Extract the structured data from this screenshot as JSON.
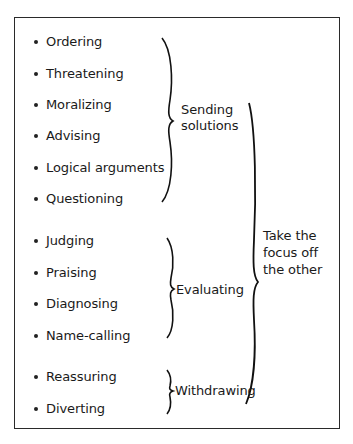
{
  "diagram": {
    "items": [
      {
        "label": "Ordering",
        "y": 34
      },
      {
        "label": "Threatening",
        "y": 66
      },
      {
        "label": "Moralizing",
        "y": 97
      },
      {
        "label": "Advising",
        "y": 128
      },
      {
        "label": "Logical arguments",
        "y": 160
      },
      {
        "label": "Questioning",
        "y": 191
      },
      {
        "label": "Judging",
        "y": 233
      },
      {
        "label": "Praising",
        "y": 265
      },
      {
        "label": "Diagnosing",
        "y": 296
      },
      {
        "label": "Name-calling",
        "y": 328
      },
      {
        "label": "Reassuring",
        "y": 369
      },
      {
        "label": "Diverting",
        "y": 401
      }
    ],
    "groups": [
      {
        "label_line1": "Sending",
        "label_line2": "solutions",
        "items": [
          "Ordering",
          "Threatening",
          "Moralizing",
          "Advising",
          "Logical arguments",
          "Questioning"
        ]
      },
      {
        "label": "Evaluating",
        "items": [
          "Judging",
          "Praising",
          "Diagnosing",
          "Name-calling"
        ]
      },
      {
        "label": "Withdrawing",
        "items": [
          "Reassuring",
          "Diverting"
        ]
      }
    ],
    "outer_group": {
      "line1": "Take the",
      "line2": "focus off",
      "line3": "the other"
    }
  }
}
